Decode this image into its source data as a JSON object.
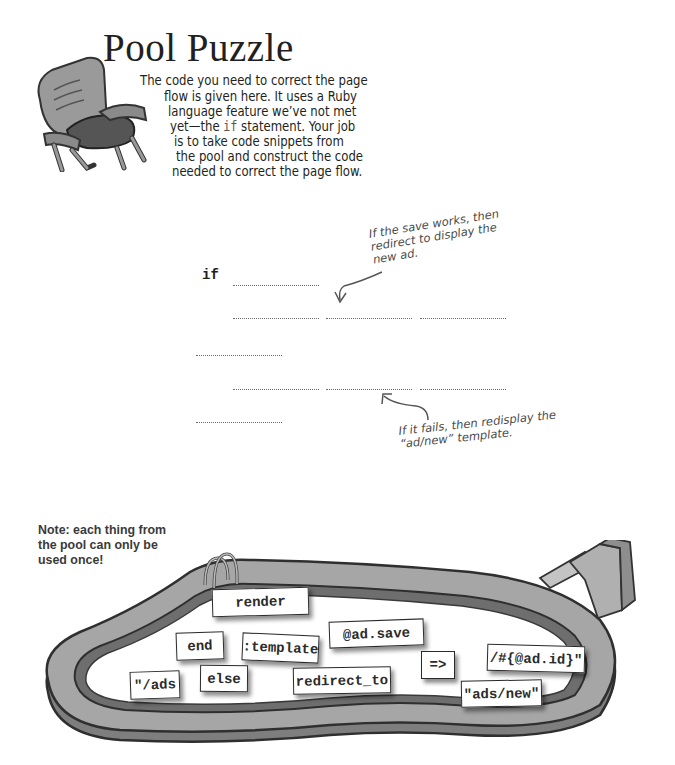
{
  "header": {
    "title": "Pool Puzzle",
    "intro_lines": [
      "The code you need to correct the page",
      "flow is given here. It uses a Ruby",
      "language feature we’ve not met",
      "yet—the",
      "if",
      " statement. Your job",
      "is to take code snippets from",
      "the pool and construct the code",
      "needed to correct the page flow."
    ],
    "illustration": "lounge-chair-icon"
  },
  "code": {
    "keyword_if": "if",
    "annotations": {
      "success": [
        "If the save works, then",
        "redirect to display the",
        "new ad."
      ],
      "failure": [
        "If it fails, then redisplay the",
        "“ad/new” template."
      ]
    }
  },
  "note": {
    "lines": [
      "Note: each thing from",
      "the pool can only be",
      "used once!"
    ]
  },
  "pool": {
    "snippets": [
      {
        "id": "render",
        "label": "render"
      },
      {
        "id": "end",
        "label": "end"
      },
      {
        "id": "template-symbol",
        "label": ":template"
      },
      {
        "id": "ad-save",
        "label": "@ad.save"
      },
      {
        "id": "ads-path-start",
        "label": "\"/ads"
      },
      {
        "id": "else",
        "label": "else"
      },
      {
        "id": "redirect-to",
        "label": "redirect_to"
      },
      {
        "id": "hash-rocket",
        "label": "=>"
      },
      {
        "id": "ad-id-interp",
        "label": "/#{@ad.id}\""
      },
      {
        "id": "ads-new",
        "label": "\"ads/new\""
      }
    ]
  }
}
